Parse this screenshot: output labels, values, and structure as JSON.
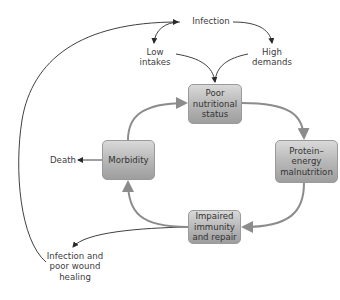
{
  "diagram": {
    "type": "cycle-flow",
    "nodes": {
      "infection": {
        "lines": [
          "Infection"
        ]
      },
      "low_intakes": {
        "lines": [
          "Low",
          "intakes"
        ]
      },
      "high_demands": {
        "lines": [
          "High",
          "demands"
        ]
      },
      "poor_nutritional_status": {
        "lines": [
          "Poor",
          "nutritional",
          "status"
        ]
      },
      "protein_energy_malnutrition": {
        "lines": [
          "Protein–",
          "energy",
          "malnutrition"
        ]
      },
      "impaired_immunity": {
        "lines": [
          "Impaired",
          "immunity",
          "and repair"
        ]
      },
      "morbidity": {
        "lines": [
          "Morbidity"
        ]
      },
      "death": {
        "lines": [
          "Death"
        ]
      },
      "infection_wound": {
        "lines": [
          "Infection and",
          "poor wound",
          "healing"
        ]
      }
    },
    "edges": [
      {
        "from": "infection",
        "to": "low_intakes"
      },
      {
        "from": "infection",
        "to": "high_demands"
      },
      {
        "from": "low_intakes",
        "to": "poor_nutritional_status"
      },
      {
        "from": "high_demands",
        "to": "poor_nutritional_status"
      },
      {
        "from": "poor_nutritional_status",
        "to": "protein_energy_malnutrition"
      },
      {
        "from": "protein_energy_malnutrition",
        "to": "impaired_immunity"
      },
      {
        "from": "impaired_immunity",
        "to": "morbidity"
      },
      {
        "from": "morbidity",
        "to": "poor_nutritional_status"
      },
      {
        "from": "morbidity",
        "to": "death"
      },
      {
        "from": "impaired_immunity",
        "to": "infection_wound"
      },
      {
        "from": "infection_wound",
        "to": "infection"
      }
    ],
    "colors": {
      "cycle_arrow": "#8c8c8c",
      "thin_arrow": "#2a2a2a",
      "box_top": "#d9d9d9",
      "box_bottom": "#9e9e9e",
      "text": "#3c3c3c"
    }
  }
}
